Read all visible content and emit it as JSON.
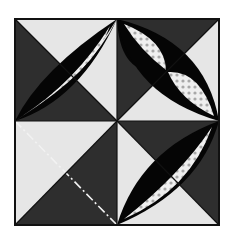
{
  "diagram": {
    "kind": "quilt-block",
    "grid": "2x2",
    "colors": {
      "dark": "#2e2e2e",
      "light": "#e6e6e6",
      "petal_dark": "#050505",
      "petal_light": "#efefef",
      "dots": "#a8a8a8",
      "border": "#111111",
      "background": "#ffffff"
    },
    "block": {
      "x": 15,
      "y": 19,
      "size_w": 204,
      "size_h": 206
    },
    "quadrants": [
      {
        "position": "top-left",
        "dark_half": "lower-left",
        "petal": true
      },
      {
        "position": "top-right",
        "dark_half": "top",
        "petal": true
      },
      {
        "position": "bottom-left",
        "dark_half": "lower-right",
        "petal": false,
        "guide_line": "dash-dot"
      },
      {
        "position": "bottom-right",
        "dark_half": "upper-right",
        "petal": true
      }
    ]
  }
}
